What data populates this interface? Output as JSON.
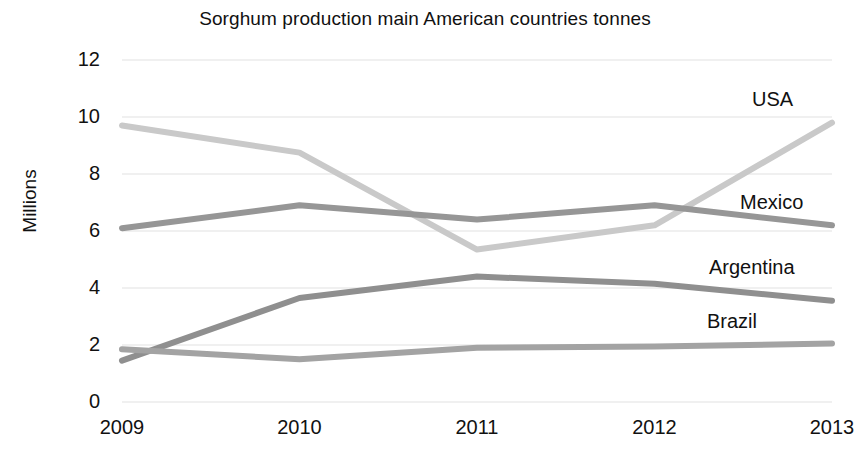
{
  "chart_data": {
    "type": "line",
    "title": "Sorghum production main American countries tonnes",
    "xlabel": "",
    "ylabel": "Millions",
    "categories": [
      "2009",
      "2010",
      "2011",
      "2012",
      "2013"
    ],
    "x": [
      2009,
      2010,
      2011,
      2012,
      2013
    ],
    "ylim": [
      0,
      12
    ],
    "yticks": [
      0,
      2,
      4,
      6,
      8,
      10,
      12
    ],
    "grid": true,
    "legend_position": "right-inline-labels",
    "series": [
      {
        "name": "USA",
        "values": [
          9.7,
          8.75,
          5.35,
          6.2,
          9.8
        ],
        "color": "#c9c9c9"
      },
      {
        "name": "Mexico",
        "values": [
          6.1,
          6.9,
          6.4,
          6.9,
          6.2
        ],
        "color": "#969696"
      },
      {
        "name": "Argentina",
        "values": [
          1.45,
          3.65,
          4.4,
          4.15,
          3.55
        ],
        "color": "#8f8f8f"
      },
      {
        "name": "Brazil",
        "values": [
          1.85,
          1.5,
          1.9,
          1.95,
          2.05
        ],
        "color": "#a3a3a3"
      }
    ]
  },
  "axis": {
    "y_title": "Millions",
    "y_tick_labels": [
      "12",
      "10",
      "8",
      "6",
      "4",
      "2",
      "0"
    ],
    "x_tick_labels": [
      "2009",
      "2010",
      "2011",
      "2012",
      "2013"
    ]
  },
  "series_labels": [
    {
      "text": "USA",
      "left": 752,
      "top": 88
    },
    {
      "text": "Mexico",
      "left": 740,
      "top": 191
    },
    {
      "text": "Argentina",
      "left": 709,
      "top": 256
    },
    {
      "text": "Brazil",
      "left": 707,
      "top": 310
    }
  ],
  "colors": {
    "background": "#ffffff",
    "text": "#111111",
    "gridline": "#e2e2e2"
  }
}
